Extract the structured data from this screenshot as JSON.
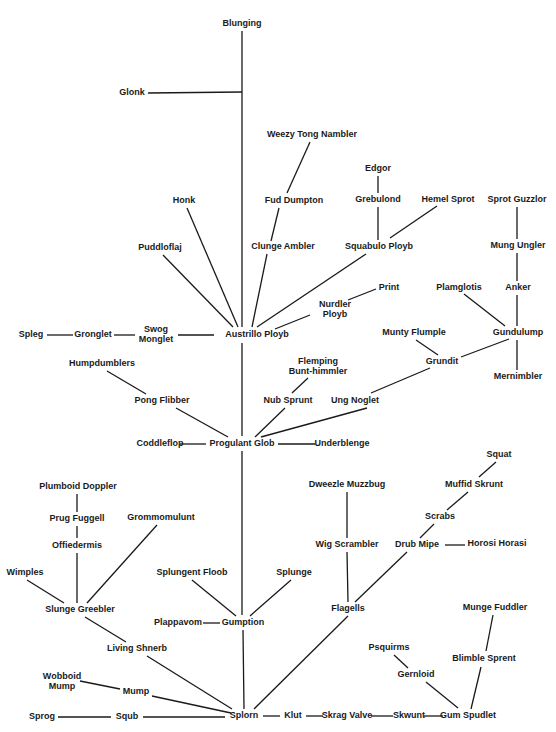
{
  "title": "",
  "nodes": [
    {
      "id": "blunging",
      "label": [
        "Blunging"
      ],
      "x": 242,
      "y": 24
    },
    {
      "id": "glonk",
      "label": [
        "Glonk"
      ],
      "x": 132,
      "y": 93
    },
    {
      "id": "weezy",
      "label": [
        "Weezy Tong Nambler"
      ],
      "x": 312,
      "y": 135
    },
    {
      "id": "edgor",
      "label": [
        "Edgor"
      ],
      "x": 378,
      "y": 169
    },
    {
      "id": "fud",
      "label": [
        "Fud Dumpton"
      ],
      "x": 294,
      "y": 201
    },
    {
      "id": "grebulond",
      "label": [
        "Grebulond"
      ],
      "x": 378,
      "y": 200
    },
    {
      "id": "hemel",
      "label": [
        "Hemel Sprot"
      ],
      "x": 448,
      "y": 200
    },
    {
      "id": "sprotguzzlor",
      "label": [
        "Sprot Guzzlor"
      ],
      "x": 517,
      "y": 200
    },
    {
      "id": "honk",
      "label": [
        "Honk"
      ],
      "x": 184,
      "y": 201
    },
    {
      "id": "puddloflaj",
      "label": [
        "Puddloflaj"
      ],
      "x": 160,
      "y": 248
    },
    {
      "id": "clunge",
      "label": [
        "Clunge Ambler"
      ],
      "x": 283,
      "y": 247
    },
    {
      "id": "squabulo",
      "label": [
        "Squabulo Ployb"
      ],
      "x": 379,
      "y": 247
    },
    {
      "id": "mungungler",
      "label": [
        "Mung Ungler"
      ],
      "x": 518,
      "y": 246
    },
    {
      "id": "print",
      "label": [
        "Print"
      ],
      "x": 389,
      "y": 288
    },
    {
      "id": "plamglotis",
      "label": [
        "Plamglotis"
      ],
      "x": 459,
      "y": 288
    },
    {
      "id": "anker",
      "label": [
        "Anker"
      ],
      "x": 518,
      "y": 288
    },
    {
      "id": "nurdler",
      "label": [
        "Nurdler",
        "Ployb"
      ],
      "x": 335,
      "y": 310
    },
    {
      "id": "spleg",
      "label": [
        "Spleg"
      ],
      "x": 31,
      "y": 335
    },
    {
      "id": "gronglet",
      "label": [
        "Gronglet"
      ],
      "x": 93,
      "y": 335
    },
    {
      "id": "swog",
      "label": [
        "Swog",
        "Monglet"
      ],
      "x": 156,
      "y": 335
    },
    {
      "id": "austrillo",
      "label": [
        "Austrillo Ployb"
      ],
      "x": 257,
      "y": 335
    },
    {
      "id": "muntyflumple",
      "label": [
        "Munty Flumple"
      ],
      "x": 414,
      "y": 333
    },
    {
      "id": "gundulump",
      "label": [
        "Gundulump"
      ],
      "x": 518,
      "y": 333
    },
    {
      "id": "grundit",
      "label": [
        "Grundit"
      ],
      "x": 442,
      "y": 362
    },
    {
      "id": "mernimbler",
      "label": [
        "Mernimbler"
      ],
      "x": 518,
      "y": 377
    },
    {
      "id": "humpdumblers",
      "label": [
        "Humpdumblers"
      ],
      "x": 102,
      "y": 364
    },
    {
      "id": "flemping",
      "label": [
        "Flemping",
        "Bunt-himmler"
      ],
      "x": 318,
      "y": 367
    },
    {
      "id": "pongflibber",
      "label": [
        "Pong Flibber"
      ],
      "x": 162,
      "y": 401
    },
    {
      "id": "nubsprunt",
      "label": [
        "Nub Sprunt"
      ],
      "x": 288,
      "y": 401
    },
    {
      "id": "ungnoglet",
      "label": [
        "Ung Noglet"
      ],
      "x": 355,
      "y": 401
    },
    {
      "id": "coddleflop",
      "label": [
        "Coddleflop"
      ],
      "x": 160,
      "y": 444
    },
    {
      "id": "progulant",
      "label": [
        "Progulant Glob"
      ],
      "x": 242,
      "y": 444
    },
    {
      "id": "underblenge",
      "label": [
        "Underblenge"
      ],
      "x": 342,
      "y": 444
    },
    {
      "id": "squat",
      "label": [
        "Squat"
      ],
      "x": 499,
      "y": 455
    },
    {
      "id": "dweezle",
      "label": [
        "Dweezle Muzzbug"
      ],
      "x": 347,
      "y": 485
    },
    {
      "id": "muffid",
      "label": [
        "Muffid Skrunt"
      ],
      "x": 474,
      "y": 485
    },
    {
      "id": "plumboid",
      "label": [
        "Plumboid Doppler"
      ],
      "x": 78,
      "y": 487
    },
    {
      "id": "prugfuggell",
      "label": [
        "Prug Fuggell"
      ],
      "x": 77,
      "y": 519
    },
    {
      "id": "grommomulunt",
      "label": [
        "Grommomulunt"
      ],
      "x": 161,
      "y": 518
    },
    {
      "id": "scrabs",
      "label": [
        "Scrabs"
      ],
      "x": 440,
      "y": 517
    },
    {
      "id": "offiedermis",
      "label": [
        "Offiedermis"
      ],
      "x": 77,
      "y": 546
    },
    {
      "id": "wigscrambler",
      "label": [
        "Wig Scrambler"
      ],
      "x": 347,
      "y": 545
    },
    {
      "id": "drubmipe",
      "label": [
        "Drub Mipe"
      ],
      "x": 417,
      "y": 545
    },
    {
      "id": "horosi",
      "label": [
        "Horosi Horasi"
      ],
      "x": 497,
      "y": 544
    },
    {
      "id": "wimples",
      "label": [
        "Wimples"
      ],
      "x": 25,
      "y": 573
    },
    {
      "id": "splungentfloob",
      "label": [
        "Splungent Floob"
      ],
      "x": 192,
      "y": 573
    },
    {
      "id": "splunge",
      "label": [
        "Splunge"
      ],
      "x": 294,
      "y": 573
    },
    {
      "id": "slungegreebler",
      "label": [
        "Slunge Greebler"
      ],
      "x": 80,
      "y": 610
    },
    {
      "id": "mungefuddler",
      "label": [
        "Munge Fuddler"
      ],
      "x": 495,
      "y": 608
    },
    {
      "id": "plappavom",
      "label": [
        "Plappavom"
      ],
      "x": 178,
      "y": 623
    },
    {
      "id": "gumption",
      "label": [
        "Gumption"
      ],
      "x": 243,
      "y": 623
    },
    {
      "id": "flagells",
      "label": [
        "Flagells"
      ],
      "x": 348,
      "y": 609
    },
    {
      "id": "livingshnerb",
      "label": [
        "Living Shnerb"
      ],
      "x": 137,
      "y": 649
    },
    {
      "id": "psquirms",
      "label": [
        "Psquirms"
      ],
      "x": 389,
      "y": 648
    },
    {
      "id": "blimblesprent",
      "label": [
        "Blimble Sprent"
      ],
      "x": 484,
      "y": 659
    },
    {
      "id": "gernloid",
      "label": [
        "Gernloid"
      ],
      "x": 416,
      "y": 675
    },
    {
      "id": "wobboid",
      "label": [
        "Wobboid",
        "Mump"
      ],
      "x": 62,
      "y": 682
    },
    {
      "id": "mump",
      "label": [
        "Mump"
      ],
      "x": 136,
      "y": 692
    },
    {
      "id": "sprog",
      "label": [
        "Sprog"
      ],
      "x": 42,
      "y": 717
    },
    {
      "id": "squb",
      "label": [
        "Squb"
      ],
      "x": 127,
      "y": 717
    },
    {
      "id": "splorn",
      "label": [
        "Splorn"
      ],
      "x": 244,
      "y": 716
    },
    {
      "id": "klut",
      "label": [
        "Klut"
      ],
      "x": 293,
      "y": 716
    },
    {
      "id": "skragvalve",
      "label": [
        "Skrag Valve"
      ],
      "x": 347,
      "y": 716
    },
    {
      "id": "skwunt",
      "label": [
        "Skwunt"
      ],
      "x": 409,
      "y": 716
    },
    {
      "id": "gumspudlet",
      "label": [
        "Gum Spudlet"
      ],
      "x": 468,
      "y": 716
    }
  ],
  "edges": [
    [
      242,
      31,
      242,
      327
    ],
    [
      148,
      93,
      242,
      92
    ],
    [
      310,
      142,
      287,
      193
    ],
    [
      279,
      208,
      271,
      241
    ],
    [
      267,
      254,
      252,
      327
    ],
    [
      378,
      176,
      378,
      193
    ],
    [
      378,
      207,
      378,
      240
    ],
    [
      437,
      206,
      390,
      238
    ],
    [
      517,
      207,
      517,
      239
    ],
    [
      517,
      253,
      517,
      281
    ],
    [
      187,
      208,
      238,
      327
    ],
    [
      163,
      255,
      233,
      327
    ],
    [
      366,
      254,
      257,
      327
    ],
    [
      310,
      315,
      275,
      329
    ],
    [
      376,
      289,
      348,
      300
    ],
    [
      47,
      335,
      73,
      335
    ],
    [
      114,
      335,
      135,
      335
    ],
    [
      178,
      335,
      214,
      335
    ],
    [
      242,
      343,
      242,
      436
    ],
    [
      464,
      294,
      505,
      326
    ],
    [
      517,
      295,
      517,
      326
    ],
    [
      517,
      340,
      517,
      370
    ],
    [
      509,
      339,
      461,
      357
    ],
    [
      416,
      340,
      438,
      355
    ],
    [
      430,
      368,
      371,
      393
    ],
    [
      367,
      408,
      261,
      437
    ],
    [
      308,
      378,
      292,
      393
    ],
    [
      285,
      408,
      255,
      437
    ],
    [
      107,
      371,
      146,
      394
    ],
    [
      176,
      408,
      228,
      437
    ],
    [
      180,
      444,
      206,
      444
    ],
    [
      278,
      444,
      315,
      444
    ],
    [
      242,
      451,
      242,
      615
    ],
    [
      496,
      462,
      479,
      477
    ],
    [
      468,
      492,
      447,
      510
    ],
    [
      434,
      524,
      420,
      538
    ],
    [
      347,
      492,
      347,
      538
    ],
    [
      445,
      545,
      465,
      545
    ],
    [
      347,
      552,
      348,
      602
    ],
    [
      407,
      552,
      355,
      602
    ],
    [
      77,
      494,
      77,
      512
    ],
    [
      77,
      526,
      77,
      538
    ],
    [
      77,
      553,
      77,
      603
    ],
    [
      157,
      525,
      87,
      603
    ],
    [
      27,
      580,
      64,
      603
    ],
    [
      192,
      580,
      236,
      616
    ],
    [
      291,
      580,
      250,
      616
    ],
    [
      203,
      623,
      220,
      623
    ],
    [
      243,
      630,
      244,
      709
    ],
    [
      348,
      616,
      254,
      709
    ],
    [
      85,
      617,
      126,
      642
    ],
    [
      147,
      656,
      232,
      709
    ],
    [
      80,
      681,
      120,
      689
    ],
    [
      152,
      696,
      231,
      713
    ],
    [
      58,
      717,
      111,
      717
    ],
    [
      143,
      717,
      225,
      717
    ],
    [
      263,
      716,
      280,
      716
    ],
    [
      306,
      716,
      323,
      716
    ],
    [
      371,
      716,
      393,
      716
    ],
    [
      424,
      716,
      443,
      716
    ],
    [
      493,
      615,
      486,
      651
    ],
    [
      481,
      667,
      471,
      709
    ],
    [
      394,
      655,
      408,
      668
    ],
    [
      426,
      682,
      458,
      708
    ]
  ]
}
